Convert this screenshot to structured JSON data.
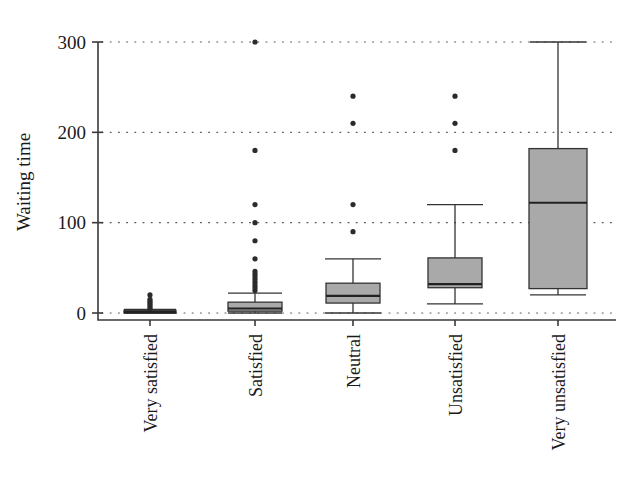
{
  "chart_data": {
    "type": "box",
    "title": "",
    "xlabel": "",
    "ylabel": "Waiting time",
    "ylim": [
      -12,
      312
    ],
    "yticks": [
      0,
      100,
      200,
      300
    ],
    "ytick_labels": [
      "0",
      "100",
      "200",
      "300"
    ],
    "grid": "horizontal-dotted",
    "legend": "none",
    "categories": [
      "Very satisfied",
      "Satisfied",
      "Neutral",
      "Unsatisfied",
      "Very unsatisfied"
    ],
    "boxes": [
      {
        "category": "Very satisfied",
        "min": 0,
        "q1": 0,
        "median": 1,
        "q3": 3,
        "whisker_low": 0,
        "whisker_high": 4,
        "outliers": [
          5,
          7,
          9,
          11,
          13,
          15,
          20
        ]
      },
      {
        "category": "Satisfied",
        "min": 0,
        "q1": 2,
        "median": 5,
        "q3": 12,
        "whisker_low": 0,
        "whisker_high": 22,
        "outliers": [
          25,
          28,
          31,
          34,
          37,
          40,
          43,
          46,
          60,
          80,
          100,
          120,
          180,
          300
        ]
      },
      {
        "category": "Neutral",
        "min": 0,
        "q1": 11,
        "median": 19,
        "q3": 33,
        "whisker_low": 0,
        "whisker_high": 60,
        "outliers": [
          90,
          120,
          210,
          240
        ]
      },
      {
        "category": "Unsatisfied",
        "min": 10,
        "q1": 28,
        "median": 32,
        "q3": 61,
        "whisker_low": 10,
        "whisker_high": 120,
        "outliers": [
          180,
          210,
          240
        ]
      },
      {
        "category": "Very unsatisfied",
        "min": 20,
        "q1": 27,
        "median": 122,
        "q3": 182,
        "whisker_low": 20,
        "whisker_high": 300,
        "outliers": []
      }
    ],
    "colors": {
      "box_fill": "#a9a9a9",
      "box_edge": "#333333",
      "median": "#222222",
      "outlier": "#2b2b2b",
      "grid": "#5a5a5a",
      "axis": "#3a3a3a",
      "background": "#ffffff"
    }
  }
}
